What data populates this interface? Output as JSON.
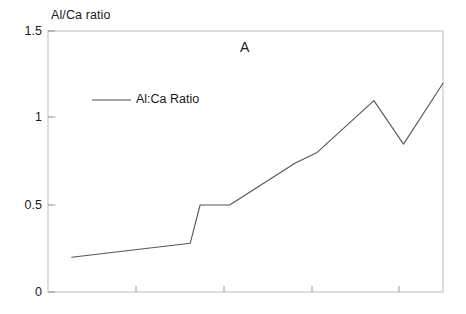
{
  "figure": {
    "background_color": "#ffffff",
    "line_color": "#555555",
    "frame_color": "#b9b9b9",
    "text_color": "#1a1a1a"
  },
  "chart_data": {
    "type": "line",
    "title": "A",
    "xlabel": "",
    "ylabel": "Al/Ca ratio",
    "ylim": [
      0,
      1.5
    ],
    "yticks": [
      0,
      0.5,
      1,
      1.5
    ],
    "ytick_labels": [
      "0",
      "0.5",
      "1",
      "1.5"
    ],
    "xlim": [
      0,
      10
    ],
    "xticks": [
      2,
      4,
      6,
      8
    ],
    "xtick_labels": [
      "",
      "",
      "",
      ""
    ],
    "grid": false,
    "legend_position": "upper-left-inside",
    "series": [
      {
        "name": "Al:Ca Ratio",
        "x": [
          0.6,
          3.6,
          3.85,
          4.6,
          6.25,
          6.8,
          8.25,
          9.0,
          10.0
        ],
        "values": [
          0.2,
          0.28,
          0.5,
          0.5,
          0.74,
          0.8,
          1.1,
          0.85,
          1.2
        ]
      }
    ]
  },
  "legend": {
    "entries": [
      {
        "label": "Al:Ca Ratio"
      }
    ]
  },
  "axes": {
    "y_axis_title": "Al/Ca ratio",
    "y_tick_top": "1.5",
    "y_tick_mid_high": "1",
    "y_tick_mid_low": "0.5",
    "y_tick_bottom": "0"
  }
}
